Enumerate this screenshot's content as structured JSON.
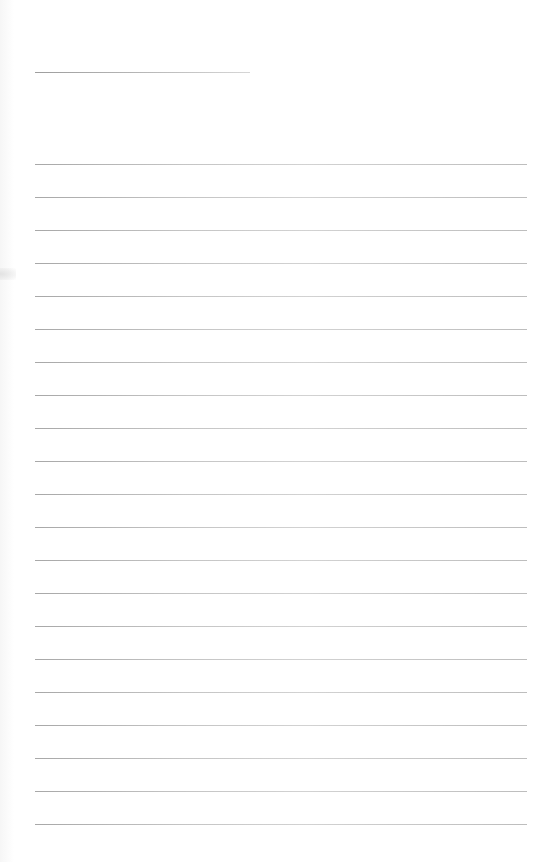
{
  "document": {
    "type": "blank lined sheet",
    "header_line": {
      "label": "",
      "value": ""
    },
    "lines": [
      {
        "text": ""
      },
      {
        "text": ""
      },
      {
        "text": ""
      },
      {
        "text": ""
      },
      {
        "text": ""
      },
      {
        "text": ""
      },
      {
        "text": ""
      },
      {
        "text": ""
      },
      {
        "text": ""
      },
      {
        "text": ""
      },
      {
        "text": ""
      },
      {
        "text": ""
      },
      {
        "text": ""
      },
      {
        "text": ""
      },
      {
        "text": ""
      },
      {
        "text": ""
      },
      {
        "text": ""
      },
      {
        "text": ""
      },
      {
        "text": ""
      },
      {
        "text": ""
      },
      {
        "text": ""
      }
    ],
    "colors": {
      "paper": "#ffffff",
      "rule": "#b8b8b8"
    }
  }
}
